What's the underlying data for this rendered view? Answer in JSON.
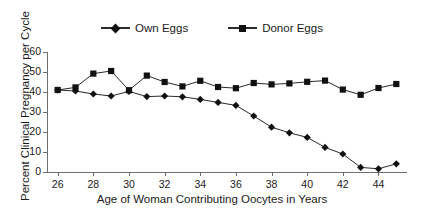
{
  "chart_data": {
    "type": "line",
    "title": "",
    "xlabel": "Age of Woman Contributing Oocytes in Years",
    "ylabel": "Percent Clinical Pregnancy per Cycle",
    "x": [
      26,
      27,
      28,
      29,
      30,
      31,
      32,
      33,
      34,
      35,
      36,
      37,
      38,
      39,
      40,
      41,
      42,
      43,
      44,
      45
    ],
    "xlim": [
      25.4,
      45.6
    ],
    "ylim": [
      0,
      60
    ],
    "xticks": [
      26,
      28,
      30,
      32,
      34,
      36,
      38,
      40,
      42,
      44
    ],
    "yticks": [
      0,
      10,
      20,
      30,
      40,
      50,
      60
    ],
    "grid": false,
    "legend_position": "top-center",
    "series": [
      {
        "name": "Own Eggs",
        "marker": "diamond",
        "color": "#111111",
        "values": [
          41.0,
          40.5,
          39.0,
          38.0,
          40.3,
          37.7,
          38.0,
          37.6,
          36.3,
          34.8,
          33.3,
          28.0,
          22.4,
          19.6,
          17.3,
          12.3,
          9.0,
          2.3,
          1.6,
          4.1
        ]
      },
      {
        "name": "Donor Eggs",
        "marker": "square",
        "color": "#111111",
        "values": [
          41.0,
          42.3,
          49.2,
          50.5,
          40.9,
          48.2,
          45.0,
          42.8,
          45.6,
          42.5,
          41.9,
          44.5,
          43.8,
          44.3,
          45.1,
          45.7,
          41.2,
          38.6,
          42.0,
          44.0
        ]
      }
    ]
  },
  "legend": {
    "entries": [
      {
        "label": "Own Eggs",
        "marker": "diamond-marker"
      },
      {
        "label": "Donor Eggs",
        "marker": "square-marker"
      }
    ]
  },
  "axes": {
    "y_labels": [
      "60",
      "50",
      "40",
      "30",
      "20",
      "10",
      "0"
    ],
    "x_labels": [
      "26",
      "28",
      "30",
      "32",
      "34",
      "36",
      "38",
      "40",
      "42",
      "44"
    ],
    "x_title": "Age of Woman Contributing Oocytes in Years",
    "y_title": "Percent Clinical Pregnancy per Cycle"
  }
}
